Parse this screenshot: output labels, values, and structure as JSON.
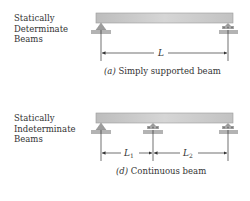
{
  "panels": [
    {
      "category_lines": [
        "Statically",
        "Determinate",
        "Beams"
      ],
      "caption_letter": "(a)",
      "caption_text": " Simply supported beam",
      "spans": [
        "L"
      ]
    },
    {
      "category_lines": [
        "Statically",
        "Indeterminate",
        "Beams"
      ],
      "caption_letter": "(d)",
      "caption_text": " Continuous beam",
      "spans": [
        "L1",
        "L2"
      ]
    }
  ],
  "colors": {
    "beam": "#c9c9c9",
    "support": "#a9a9a9",
    "line": "#333333"
  }
}
